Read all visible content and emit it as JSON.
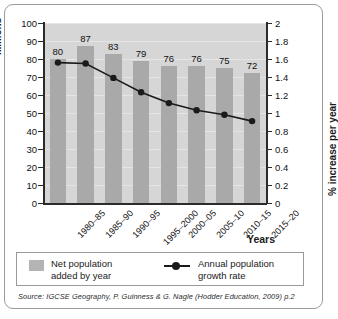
{
  "chart_data": {
    "type": "bar",
    "title": "",
    "subtitle": "",
    "categories": [
      "1980–85",
      "1985–90",
      "1990–95",
      "1995–2000",
      "2000–05",
      "2005–10",
      "2010–15",
      "2015–20"
    ],
    "xlabel": "Years",
    "grid": true,
    "legend_position": "bottom",
    "series": [
      {
        "name": "Net population added by year",
        "type": "bar",
        "axis": "left",
        "unit": "Millions",
        "values": [
          80,
          87,
          83,
          79,
          76,
          76,
          75,
          72
        ],
        "data_labels": [
          "80",
          "87",
          "83",
          "79",
          "76",
          "76",
          "75",
          "72"
        ],
        "color": "#a9a9a9"
      },
      {
        "name": "Annual population growth rate",
        "type": "line",
        "axis": "right",
        "unit": "% increase per year",
        "values": [
          1.56,
          1.55,
          1.39,
          1.23,
          1.11,
          1.03,
          0.98,
          0.91
        ],
        "color": "#1a1a1a"
      }
    ],
    "axes": {
      "left": {
        "label": "Millions",
        "ylim": [
          0,
          100
        ],
        "ticks": [
          0,
          10,
          20,
          30,
          40,
          50,
          60,
          70,
          80,
          90,
          100
        ],
        "tick_labels": [
          "0",
          "10",
          "20",
          "30",
          "40",
          "50",
          "60",
          "70",
          "80",
          "90",
          "100"
        ]
      },
      "right": {
        "label": "% increase per year",
        "ylim": [
          0,
          2
        ],
        "ticks": [
          0,
          0.2,
          0.4,
          0.6,
          0.8,
          1,
          1.2,
          1.4,
          1.6,
          1.8,
          2
        ],
        "tick_labels": [
          "0",
          "0.2",
          "0.4",
          "0.6",
          "0.8",
          "1",
          "1.2",
          "1.4",
          "1.6",
          "1.8",
          "2"
        ]
      }
    }
  },
  "legend": {
    "bar_label_line1": "Net population",
    "bar_label_line2": "added by year",
    "line_label_line1": "Annual population",
    "line_label_line2": "growth rate"
  },
  "source": {
    "text": "Source: IGCSE Geography, P. Guinness & G. Nagle (Hodder Education, 2009) p.2"
  }
}
